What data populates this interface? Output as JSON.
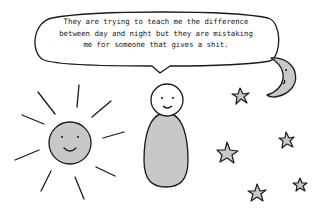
{
  "speech_bubble": {
    "lines": [
      "They are trying to teach me the difference",
      "between day and night but they are mistaking",
      "me for someone that gives a shit."
    ]
  },
  "colors": {
    "stroke": "#1a1a1a",
    "fill": "#c8c8c8",
    "background": "#ffffff"
  },
  "figures": [
    "sun-with-face",
    "person",
    "crescent-moon-with-face",
    "stars"
  ]
}
